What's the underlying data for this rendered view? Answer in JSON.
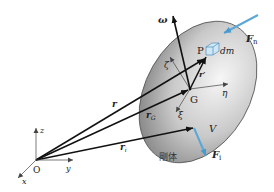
{
  "diagram": {
    "type": "rigid-body-kinematics",
    "colors": {
      "body_light": "#f4f4f4",
      "body_dark": "#8a8a8a",
      "force_arrow": "#5aa7d8",
      "vector": "#111111",
      "axis": "#444444",
      "cube": "#cfe6f5"
    },
    "labels": {
      "omega": "ω",
      "F_n": "F",
      "F_n_sub": "n",
      "F_i": "F",
      "F_i_sub": "i",
      "P": "P",
      "dm": "dm",
      "zeta": "ζ",
      "r_prime": "r′",
      "G": "G",
      "eta": "η",
      "r": "r",
      "r_G": "r",
      "r_G_sub": "G",
      "xi": "ξ",
      "V": "V",
      "r_i": "r",
      "r_i_sub": "i",
      "z": "z",
      "y": "y",
      "x": "x",
      "O": "O",
      "body_caption": "剛体"
    }
  }
}
